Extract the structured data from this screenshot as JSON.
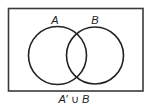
{
  "diagram": {
    "type": "venn",
    "universal_set": {
      "x": 8.5,
      "y": 8.5,
      "width": 134.5,
      "height": 82.5,
      "stroke": "#3a3a3a"
    },
    "circles": [
      {
        "label": "A",
        "cx": 57.5,
        "cy": 55.5,
        "r": 29,
        "label_x": 55,
        "label_y": 24
      },
      {
        "label": "B",
        "cx": 95,
        "cy": 55.5,
        "r": 28.5,
        "label_x": 95,
        "label_y": 24
      }
    ],
    "shaded_region": "none",
    "caption": {
      "set_a": "A",
      "prime": "′",
      "operator": " ∪ ",
      "set_b": "B",
      "full": "A′ ∪ B"
    },
    "colors": {
      "line": "#222222",
      "background": "#ffffff"
    }
  }
}
